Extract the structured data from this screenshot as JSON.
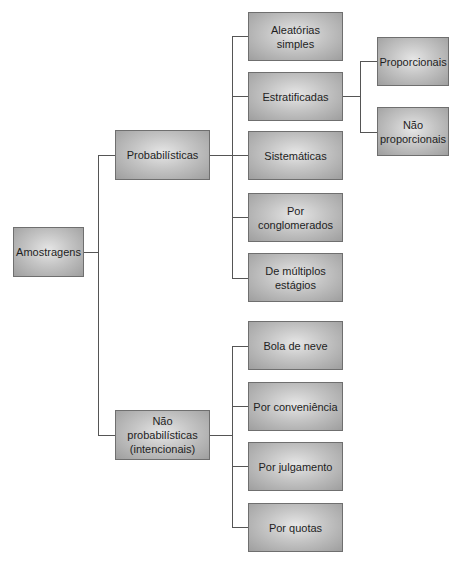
{
  "diagram": {
    "root": {
      "label": "Amostragens"
    },
    "level1": [
      {
        "label": "Probabilísticas"
      },
      {
        "label": "Não probabilísticas\n(intencionais)"
      }
    ],
    "probabilisticas_children": [
      {
        "label": "Aleatórias simples"
      },
      {
        "label": "Estratificadas"
      },
      {
        "label": "Sistemáticas"
      },
      {
        "label": "Por conglomerados"
      },
      {
        "label": "De múltiplos\nestágios"
      }
    ],
    "estratificadas_children": [
      {
        "label": "Proporcionais"
      },
      {
        "label": "Não\nproporcionais"
      }
    ],
    "nao_probabilisticas_children": [
      {
        "label": "Bola de neve"
      },
      {
        "label": "Por conveniência"
      },
      {
        "label": "Por julgamento"
      },
      {
        "label": "Por quotas"
      }
    ]
  }
}
